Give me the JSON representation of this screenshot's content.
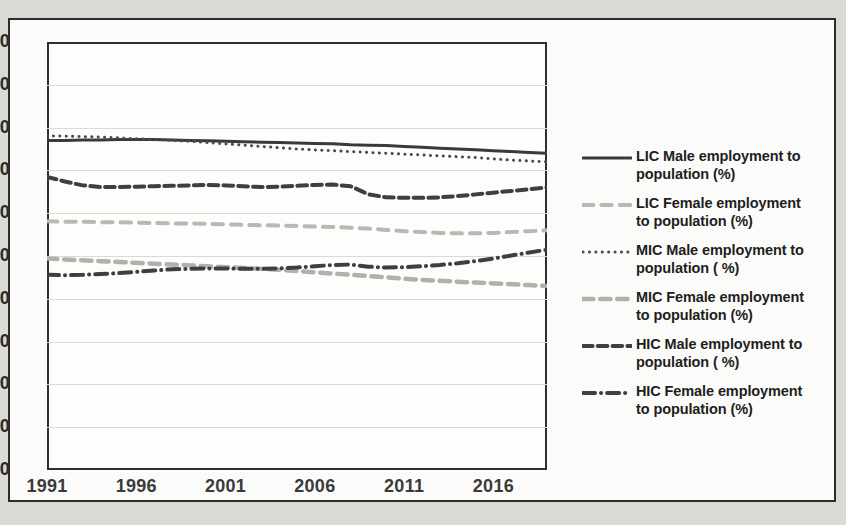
{
  "chart_data": {
    "type": "line",
    "title": "",
    "xlabel": "",
    "ylabel": "",
    "xlim": [
      1991,
      2019
    ],
    "ylim": [
      0,
      100
    ],
    "ytick_values": [
      0,
      10,
      20,
      30,
      40,
      50,
      60,
      70,
      80,
      90,
      100
    ],
    "ytick_labels": [
      "0",
      "10",
      "20",
      "30",
      "40",
      "50",
      "60",
      "70",
      "80",
      "90",
      "100"
    ],
    "xtick_values": [
      1991,
      1996,
      2001,
      2006,
      2011,
      2016
    ],
    "xtick_labels": [
      "1991",
      "1996",
      "2001",
      "2006",
      "2011",
      "2016"
    ],
    "grid": true,
    "grid_axis": "y",
    "legend_position": "right",
    "x": [
      1991,
      1992,
      1993,
      1994,
      1995,
      1996,
      1997,
      1998,
      1999,
      2000,
      2001,
      2002,
      2003,
      2004,
      2005,
      2006,
      2007,
      2008,
      2009,
      2010,
      2011,
      2012,
      2013,
      2014,
      2015,
      2016,
      2017,
      2018,
      2019
    ],
    "series": [
      {
        "name": "LIC Male employment to population (%)",
        "color": "#3a3a3a",
        "style": "solid",
        "width": 3.0,
        "values": [
          77.0,
          77.0,
          77.1,
          77.1,
          77.2,
          77.2,
          77.2,
          77.1,
          77.0,
          76.9,
          76.8,
          76.7,
          76.6,
          76.5,
          76.4,
          76.3,
          76.2,
          76.0,
          75.9,
          75.8,
          75.6,
          75.4,
          75.2,
          75.0,
          74.8,
          74.6,
          74.4,
          74.2,
          74.0
        ]
      },
      {
        "name": "LIC Female employment to population (%)",
        "color": "#b8b8b4",
        "style": "long-dash",
        "width": 4.0,
        "values": [
          58.1,
          58.0,
          58.0,
          57.9,
          57.9,
          57.8,
          57.7,
          57.6,
          57.6,
          57.5,
          57.4,
          57.3,
          57.2,
          57.1,
          57.0,
          56.9,
          56.8,
          56.6,
          56.4,
          56.1,
          55.8,
          55.6,
          55.4,
          55.3,
          55.3,
          55.4,
          55.6,
          55.8,
          56.0
        ]
      },
      {
        "name": "MIC Male employment to population ( %)",
        "color": "#4a4a4a",
        "style": "dotted",
        "width": 3.0,
        "values": [
          78.1,
          78.0,
          77.9,
          77.8,
          77.6,
          77.4,
          77.2,
          77.0,
          76.8,
          76.5,
          76.2,
          75.9,
          75.6,
          75.3,
          75.0,
          74.8,
          74.6,
          74.4,
          74.2,
          74.0,
          73.8,
          73.6,
          73.4,
          73.2,
          73.0,
          72.7,
          72.4,
          72.2,
          72.0
        ]
      },
      {
        "name": "MIC Female employment to population (%)",
        "color": "#b0b0ac",
        "style": "fine-dash",
        "width": 4.5,
        "values": [
          49.4,
          49.2,
          49.0,
          48.8,
          48.6,
          48.4,
          48.2,
          48.0,
          47.8,
          47.6,
          47.4,
          47.2,
          47.0,
          46.8,
          46.5,
          46.2,
          45.9,
          45.6,
          45.3,
          45.0,
          44.7,
          44.4,
          44.2,
          44.0,
          43.8,
          43.6,
          43.4,
          43.2,
          43.0
        ]
      },
      {
        "name": "HIC Male employment to population ( %)",
        "color": "#3f3f3f",
        "style": "dash-dash-dot",
        "width": 4.0,
        "values": [
          68.5,
          67.4,
          66.5,
          66.1,
          66.1,
          66.2,
          66.3,
          66.4,
          66.5,
          66.6,
          66.5,
          66.3,
          66.1,
          66.2,
          66.4,
          66.6,
          66.7,
          66.3,
          64.4,
          63.7,
          63.6,
          63.6,
          63.7,
          64.0,
          64.4,
          64.8,
          65.2,
          65.6,
          66.0
        ]
      },
      {
        "name": "HIC Female employment to population (%)",
        "color": "#3f3f3f",
        "style": "long-dash-dot",
        "width": 4.0,
        "values": [
          45.6,
          45.5,
          45.6,
          45.8,
          46.0,
          46.3,
          46.6,
          46.9,
          47.0,
          47.1,
          47.1,
          47.0,
          47.0,
          47.1,
          47.3,
          47.6,
          47.9,
          48.0,
          47.5,
          47.3,
          47.4,
          47.6,
          47.9,
          48.3,
          48.8,
          49.4,
          50.1,
          50.8,
          51.5
        ]
      }
    ]
  },
  "legend": {
    "items": [
      {
        "label_line1": "LIC Male employment to",
        "label_line2": "population (%)"
      },
      {
        "label_line1": "LIC Female employment",
        "label_line2": "to population (%)"
      },
      {
        "label_line1": "MIC Male employment to",
        "label_line2": "population ( %)"
      },
      {
        "label_line1": "MIC Female employment",
        "label_line2": "to population (%)"
      },
      {
        "label_line1": "HIC Male employment to",
        "label_line2": "population ( %)"
      },
      {
        "label_line1": "HIC Female employment",
        "label_line2": "to population (%)"
      }
    ]
  }
}
